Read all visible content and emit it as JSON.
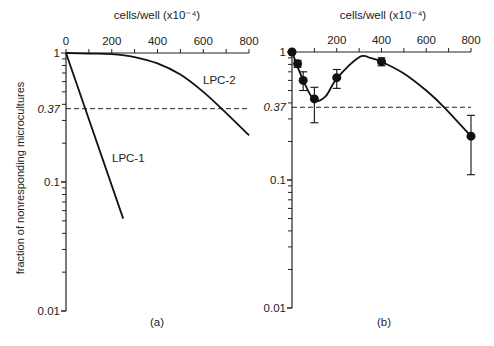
{
  "figure": {
    "ylabel": "fraction of nonresponding microcultures",
    "panel_a_label": "(a)",
    "panel_b_label": "(b)",
    "xlabel_a": "cells/well (x10⁻⁴)",
    "xlabel_b": "cells/well (x10⁻⁴)",
    "ref_label": "0.37",
    "lpc1_label": "LPC-1",
    "lpc2_label": "LPC-2",
    "xtick_labels": [
      "0",
      "200",
      "400",
      "600",
      "800"
    ],
    "xtick_labels_b": [
      "200",
      "400",
      "600",
      "800"
    ],
    "ytick_labels": [
      "1",
      "0.1",
      "0.01"
    ]
  },
  "chart_data": [
    {
      "type": "line",
      "panel": "(a)",
      "title": "",
      "xlabel": "cells/well (x10^-4)",
      "ylabel": "fraction of nonresponding microcultures",
      "xscale": "linear",
      "yscale": "log",
      "xlim": [
        0,
        800
      ],
      "ylim": [
        0.01,
        1
      ],
      "xticks": [
        0,
        200,
        400,
        600,
        800
      ],
      "yticks": [
        1,
        0.37,
        0.1,
        0.01
      ],
      "reference_line": {
        "y": 0.37,
        "style": "dashed"
      },
      "series": [
        {
          "name": "LPC-1",
          "x": [
            0,
            250
          ],
          "y": [
            1.0,
            0.052
          ]
        },
        {
          "name": "LPC-2",
          "x": [
            0,
            100,
            200,
            300,
            400,
            500,
            600,
            680,
            800
          ],
          "y": [
            1.0,
            0.99,
            0.98,
            0.93,
            0.83,
            0.68,
            0.5,
            0.37,
            0.23
          ]
        }
      ]
    },
    {
      "type": "scatter",
      "panel": "(b)",
      "title": "",
      "xlabel": "cells/well (x10^-4)",
      "ylabel": "fraction of nonresponding microcultures",
      "xscale": "linear",
      "yscale": "log",
      "xlim": [
        0,
        800
      ],
      "ylim": [
        0.01,
        1
      ],
      "xticks": [
        0,
        200,
        400,
        600,
        800
      ],
      "yticks": [
        1,
        0.37,
        0.1,
        0.01
      ],
      "reference_line": {
        "y": 0.37,
        "style": "dashed"
      },
      "series": [
        {
          "name": "measured",
          "x": [
            0,
            25,
            50,
            100,
            200,
            400,
            800
          ],
          "y": [
            1.0,
            0.81,
            0.6,
            0.43,
            0.63,
            0.84,
            0.22
          ],
          "err_low": [
            1.0,
            0.76,
            0.5,
            0.28,
            0.52,
            0.78,
            0.11
          ],
          "err_high": [
            1.0,
            0.86,
            0.7,
            0.53,
            0.73,
            0.9,
            0.32
          ]
        },
        {
          "name": "fit",
          "x": [
            0,
            50,
            100,
            150,
            200,
            300,
            350,
            400,
            500,
            600,
            680,
            800
          ],
          "y": [
            1.0,
            0.6,
            0.42,
            0.45,
            0.62,
            0.91,
            0.9,
            0.84,
            0.68,
            0.5,
            0.37,
            0.22
          ]
        }
      ]
    }
  ]
}
